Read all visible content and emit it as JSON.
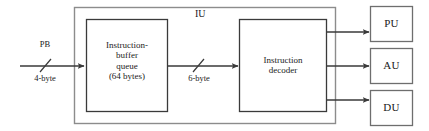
{
  "diagram": {
    "colors": {
      "stroke": "#3a3a3a",
      "outer_stroke": "#8c8c8c",
      "text": "#1a1a1a",
      "background": "#ffffff"
    },
    "container": {
      "label": "IU",
      "label_x": 201,
      "label_y": 9,
      "x": 74,
      "y": 7,
      "width": 262,
      "height": 117
    },
    "blocks": [
      {
        "name": "instruction-buffer-queue",
        "label": "Instruction-\nbuffer\nqueue\n(64 bytes)",
        "x": 86,
        "y": 19,
        "width": 82,
        "height": 93,
        "font_size": 9
      },
      {
        "name": "instruction-decoder",
        "label": "Instruction\ndecoder",
        "x": 239,
        "y": 19,
        "width": 88,
        "height": 93,
        "font_size": 9
      },
      {
        "name": "pu-unit",
        "label": "PU",
        "x": 370,
        "y": 6,
        "width": 43,
        "height": 36,
        "font_size": 11
      },
      {
        "name": "au-unit",
        "label": "AU",
        "x": 370,
        "y": 48,
        "width": 43,
        "height": 36,
        "font_size": 11
      },
      {
        "name": "du-unit",
        "label": "DU",
        "x": 370,
        "y": 90,
        "width": 43,
        "height": 36,
        "font_size": 11
      }
    ],
    "connections": [
      {
        "name": "prefetch-bus-input",
        "top_label": "PB",
        "bottom_label": "4-byte",
        "x1": 20,
        "y1": 66,
        "x2": 85,
        "y2": 66,
        "tick_x": 45,
        "top_label_x": 45,
        "top_label_y": 43,
        "bottom_label_x": 45,
        "bottom_label_y": 74
      },
      {
        "name": "queue-to-decoder",
        "top_label": "",
        "bottom_label": "6-byte",
        "x1": 168,
        "y1": 66,
        "x2": 238,
        "y2": 66,
        "tick_x": 198,
        "bottom_label_x": 199,
        "bottom_label_y": 74
      },
      {
        "name": "decoder-to-pu",
        "x1": 327,
        "y1": 32,
        "x2": 369,
        "y2": 32
      },
      {
        "name": "decoder-to-au",
        "x1": 327,
        "y1": 66,
        "x2": 369,
        "y2": 66
      },
      {
        "name": "decoder-to-du",
        "x1": 327,
        "y1": 100,
        "x2": 369,
        "y2": 100
      }
    ]
  }
}
